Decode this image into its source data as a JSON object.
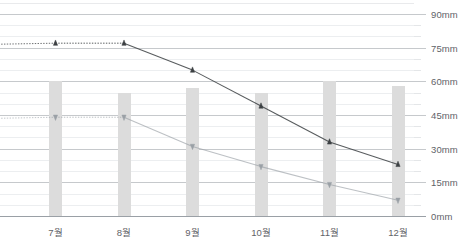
{
  "chart_data": {
    "type": "line",
    "title": "",
    "subtitle": "",
    "xlabel": "",
    "ylabel": "",
    "unit": "mm",
    "categories": [
      "7월",
      "8월",
      "9월",
      "10월",
      "11월",
      "12월"
    ],
    "ylim": [
      0,
      90
    ],
    "yticks": [
      0,
      15,
      30,
      45,
      60,
      75,
      90
    ],
    "ytick_labels": [
      "0mm",
      "15mm",
      "30mm",
      "45mm",
      "60mm",
      "75mm",
      "90mm"
    ],
    "minor_tick_step": 5,
    "grid": true,
    "legend": "none",
    "series": [
      {
        "name": "upper-series",
        "marker": "triangle-up",
        "color": "#3c4043",
        "line_style": "dotted-solid",
        "values": [
          77,
          77,
          65,
          49,
          33,
          23
        ]
      },
      {
        "name": "lower-series",
        "marker": "triangle-down",
        "color": "#9aa0a6",
        "line_style": "dotted-solid",
        "values": [
          44,
          44,
          31,
          22,
          14,
          7
        ]
      },
      {
        "name": "bars",
        "type": "bar",
        "color": "#dcdcdc",
        "values": [
          60,
          55,
          57,
          55,
          60,
          58
        ]
      }
    ]
  },
  "axis": {
    "y_unit_suffix": "mm"
  }
}
